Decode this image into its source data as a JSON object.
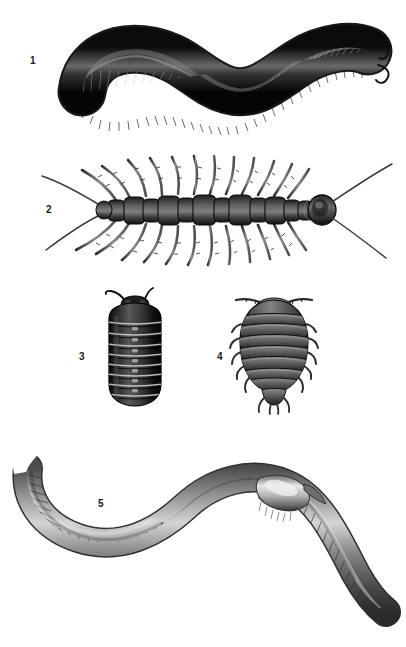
{
  "plate": {
    "title": "Myriapoda and Isopoda engraved plate",
    "background_color": "#ffffff",
    "width": 406,
    "height": 647,
    "style": "monochrome engraving / halftone scientific illustration"
  },
  "figures": [
    {
      "number": "1",
      "name": "giant-millipede",
      "description": "Large dark millipede with sinuous S-curved body, dense segment rings and fine bristly legs along the underside, two short curved antennae at the right head end",
      "orientation": "horizontal S-curve, head at right",
      "body_color": "#151515",
      "highlight_color": "#6e6e6e",
      "label_position": {
        "x": 30,
        "y": 56
      }
    },
    {
      "number": "2",
      "name": "centipede",
      "description": "Dorsal view of a centipede with segmented trunk plates, long paired legs radiating above and below, long antennae at the head (right) and long trailing cerci at the rear (left)",
      "orientation": "horizontal, head at right",
      "body_color": "#3c3c3c",
      "highlight_color": "#8e8e8e",
      "label_position": {
        "x": 46,
        "y": 205
      }
    },
    {
      "number": "3",
      "name": "pill-millipede",
      "description": "Dorsal view of a pill millipede: dark ovoid body crossed by pale segment bands, small head plate with two curved antennae at top",
      "orientation": "vertical, head at top",
      "body_color": "#1c1c1c",
      "highlight_color": "#c9c9c9",
      "label_position": {
        "x": 79,
        "y": 352
      }
    },
    {
      "number": "4",
      "name": "woodlouse",
      "description": "Dorsal view of a woodlouse (sow bug): broad flattened oval body of overlapping tergite plates with spiny lateral edges, legs protruding at the sides, two segmented antennae at top, small uropods at the rear",
      "orientation": "vertical, head at top",
      "body_color": "#4a4a4a",
      "highlight_color": "#9c9c9c",
      "label_position": {
        "x": 217,
        "y": 352
      }
    },
    {
      "number": "5",
      "name": "smooth-millipede",
      "description": "Long smooth cylindrical millipede in a broad S-curve, finely ringed along its length, with a glossy light collar plate behind the head at upper right and tapered pointed tail ends",
      "orientation": "S-curve, head at right",
      "body_color": "#70706e",
      "highlight_color": "#e2e2e0",
      "label_position": {
        "x": 98,
        "y": 499
      }
    }
  ]
}
